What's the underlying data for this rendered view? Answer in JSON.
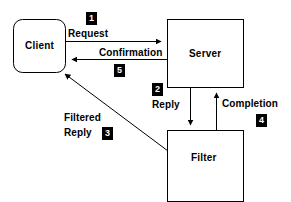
{
  "diagram": {
    "type": "flow-diagram",
    "colors": {
      "background": "#ffffff",
      "stroke": "#000000",
      "badge_background": "#000000",
      "badge_text": "#ffffff",
      "node_fill": "#ffffff"
    },
    "nodes": [
      {
        "id": "client",
        "label": "Client",
        "shape": "rounded-rect"
      },
      {
        "id": "server",
        "label": "Server",
        "shape": "rect"
      },
      {
        "id": "filter",
        "label": "Filter",
        "shape": "rect"
      }
    ],
    "edges": [
      {
        "id": "request",
        "label": "Request",
        "step": "1",
        "from": "client",
        "to": "server",
        "direction": "right"
      },
      {
        "id": "confirmation",
        "label": "Confirmation",
        "step": "5",
        "from": "server",
        "to": "client",
        "direction": "left"
      },
      {
        "id": "reply",
        "label": "Reply",
        "step": "2",
        "from": "server",
        "to": "filter",
        "direction": "down"
      },
      {
        "id": "completion",
        "label": "Completion",
        "step": "4",
        "from": "filter",
        "to": "server",
        "direction": "up"
      },
      {
        "id": "filtered-reply",
        "label_line1": "Filtered",
        "label_line2": "Reply",
        "step": "3",
        "from": "filter",
        "to": "client",
        "direction": "diagonal-up-left"
      }
    ]
  }
}
